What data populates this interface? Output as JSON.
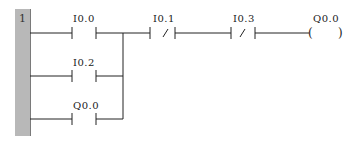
{
  "network": {
    "number": "1",
    "contacts": [
      {
        "id": "I0.0",
        "label": "I0.0",
        "type": "NO",
        "row": 0
      },
      {
        "id": "I0.2",
        "label": "I0.2",
        "type": "NO",
        "row": 1
      },
      {
        "id": "Q0.0_seal",
        "label": "Q0.0",
        "type": "NO",
        "row": 2
      },
      {
        "id": "I0.1",
        "label": "I0.1",
        "type": "NC",
        "row": 0
      },
      {
        "id": "I0.3",
        "label": "I0.3",
        "type": "NC",
        "row": 0
      }
    ],
    "coil": {
      "label": "Q0.0",
      "type": "coil"
    }
  },
  "colors": {
    "rail": "#b8b8b8",
    "line": "#222222"
  }
}
